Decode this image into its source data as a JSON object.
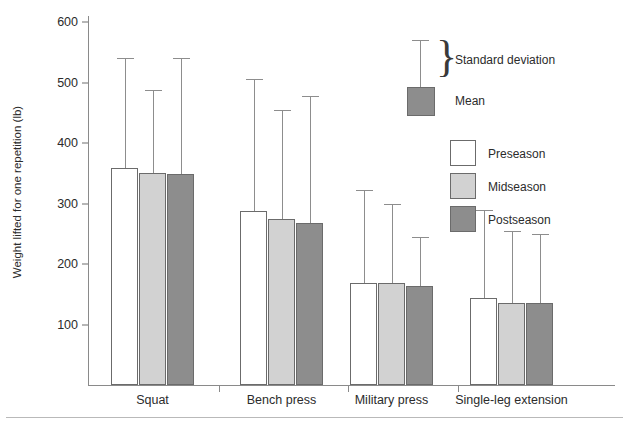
{
  "chart_data": {
    "type": "bar",
    "title": "",
    "xlabel": "",
    "ylabel": "Weight lifted for one repetition (lb)",
    "categories": [
      "Squat",
      "Bench press",
      "Military press",
      "Single-leg extension"
    ],
    "ylim": [
      0,
      620
    ],
    "yticks": [
      100,
      200,
      300,
      400,
      500,
      600
    ],
    "ytick_labels": [
      "100",
      "200",
      "300",
      "400",
      "500",
      "600"
    ],
    "grid": false,
    "legend_position": "upper-right",
    "error_bars": "standard deviation (upper only)",
    "series": [
      {
        "name": "Preseason",
        "color": "#ffffff",
        "values": [
          358,
          288,
          168,
          144
        ],
        "error_tops": [
          540,
          505,
          323,
          290
        ]
      },
      {
        "name": "Midseason",
        "color": "#d2d2d2",
        "values": [
          350,
          275,
          168,
          136
        ],
        "error_tops": [
          488,
          455,
          300,
          255
        ]
      },
      {
        "name": "Postseason",
        "color": "#8d8d8d",
        "values": [
          349,
          268,
          164,
          135
        ],
        "error_tops": [
          540,
          478,
          245,
          250
        ]
      }
    ]
  },
  "legend": {
    "sd_label": "Standard deviation",
    "mean_label": "Mean",
    "brace_glyph": "}",
    "series_labels": [
      "Preseason",
      "Midseason",
      "Postseason"
    ]
  },
  "colors": {
    "preseason": "#ffffff",
    "midseason": "#d2d2d2",
    "postseason": "#8d8d8d",
    "axis": "#8a8a8a",
    "bar_border": "#6b6b6b",
    "text": "#2b2b2b"
  }
}
